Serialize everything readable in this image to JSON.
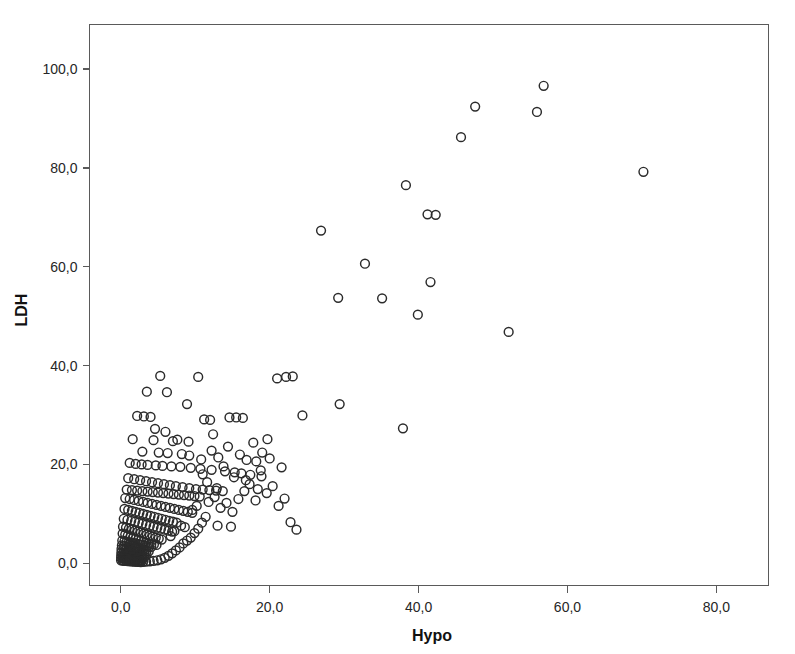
{
  "chart_data": {
    "type": "scatter",
    "title": "",
    "xlabel": "Hypo",
    "ylabel": "LDH",
    "xlim": [
      -4.2,
      87.0
    ],
    "ylim": [
      -4.5,
      109.0
    ],
    "grid": false,
    "legend": null,
    "marker": {
      "shape": "open-circle",
      "radius_px": 4.4,
      "stroke_color": "#2b2b2b",
      "stroke_width_px": 1.45,
      "fill": "none"
    },
    "xticks": [
      0,
      20,
      40,
      60,
      80
    ],
    "xtick_labels": [
      "0,0",
      "20,0",
      "40,0",
      "60,0",
      "80,0"
    ],
    "yticks": [
      0,
      20,
      40,
      60,
      80,
      100
    ],
    "ytick_labels": [
      "0,0",
      "20,0",
      "40,0",
      "60,0",
      "80,0",
      "100,0"
    ],
    "decimal_separator": ",",
    "n_points": 301,
    "points": [
      [
        56.8,
        96.6
      ],
      [
        47.6,
        92.4
      ],
      [
        55.9,
        91.3
      ],
      [
        45.7,
        86.2
      ],
      [
        70.2,
        79.2
      ],
      [
        38.3,
        76.5
      ],
      [
        41.2,
        70.6
      ],
      [
        42.3,
        70.5
      ],
      [
        26.9,
        67.3
      ],
      [
        32.8,
        60.6
      ],
      [
        41.6,
        56.9
      ],
      [
        29.2,
        53.7
      ],
      [
        35.1,
        53.6
      ],
      [
        52.1,
        46.8
      ],
      [
        39.9,
        50.3
      ],
      [
        29.4,
        32.2
      ],
      [
        37.9,
        27.3
      ],
      [
        23.1,
        37.8
      ],
      [
        22.2,
        37.7
      ],
      [
        21.0,
        37.4
      ],
      [
        10.4,
        37.7
      ],
      [
        5.3,
        37.9
      ],
      [
        8.9,
        32.2
      ],
      [
        3.5,
        34.7
      ],
      [
        6.2,
        34.6
      ],
      [
        2.2,
        29.8
      ],
      [
        3.1,
        29.7
      ],
      [
        4.0,
        29.6
      ],
      [
        14.6,
        29.5
      ],
      [
        15.5,
        29.5
      ],
      [
        16.4,
        29.4
      ],
      [
        11.2,
        29.1
      ],
      [
        12.0,
        29.0
      ],
      [
        1.6,
        25.1
      ],
      [
        4.4,
        24.9
      ],
      [
        7.0,
        24.7
      ],
      [
        9.1,
        24.6
      ],
      [
        2.9,
        22.6
      ],
      [
        5.1,
        22.4
      ],
      [
        6.3,
        22.3
      ],
      [
        8.2,
        22.1
      ],
      [
        13.1,
        21.4
      ],
      [
        16.9,
        20.9
      ],
      [
        18.2,
        20.6
      ],
      [
        24.4,
        29.9
      ],
      [
        12.4,
        26.1
      ],
      [
        19.7,
        25.1
      ],
      [
        1.2,
        20.3
      ],
      [
        2.0,
        20.1
      ],
      [
        2.8,
        20.0
      ],
      [
        3.6,
        19.9
      ],
      [
        4.7,
        19.8
      ],
      [
        5.6,
        19.7
      ],
      [
        6.8,
        19.6
      ],
      [
        8.0,
        19.5
      ],
      [
        9.4,
        19.3
      ],
      [
        10.7,
        19.1
      ],
      [
        12.2,
        18.9
      ],
      [
        14.0,
        18.6
      ],
      [
        15.3,
        18.4
      ],
      [
        16.2,
        18.2
      ],
      [
        17.4,
        17.9
      ],
      [
        18.9,
        17.6
      ],
      [
        1.0,
        17.2
      ],
      [
        1.8,
        17.0
      ],
      [
        2.6,
        16.8
      ],
      [
        3.4,
        16.6
      ],
      [
        4.2,
        16.4
      ],
      [
        5.0,
        16.2
      ],
      [
        5.8,
        16.0
      ],
      [
        6.6,
        15.8
      ],
      [
        7.4,
        15.6
      ],
      [
        8.3,
        15.4
      ],
      [
        9.2,
        15.2
      ],
      [
        10.1,
        15.0
      ],
      [
        11.0,
        14.9
      ],
      [
        11.9,
        14.8
      ],
      [
        12.8,
        14.7
      ],
      [
        13.7,
        14.6
      ],
      [
        0.8,
        14.9
      ],
      [
        1.5,
        14.8
      ],
      [
        2.2,
        14.7
      ],
      [
        2.9,
        14.6
      ],
      [
        3.6,
        14.5
      ],
      [
        4.3,
        14.4
      ],
      [
        5.0,
        14.3
      ],
      [
        5.7,
        14.2
      ],
      [
        6.4,
        14.1
      ],
      [
        7.1,
        14.0
      ],
      [
        7.8,
        13.9
      ],
      [
        8.5,
        13.8
      ],
      [
        9.2,
        13.7
      ],
      [
        9.9,
        13.6
      ],
      [
        10.6,
        13.5
      ],
      [
        0.6,
        13.2
      ],
      [
        1.2,
        13.0
      ],
      [
        1.8,
        12.8
      ],
      [
        2.4,
        12.6
      ],
      [
        3.0,
        12.4
      ],
      [
        3.6,
        12.2
      ],
      [
        4.2,
        12.0
      ],
      [
        4.8,
        11.8
      ],
      [
        5.4,
        11.6
      ],
      [
        6.0,
        11.4
      ],
      [
        6.6,
        11.2
      ],
      [
        7.2,
        11.0
      ],
      [
        7.8,
        10.8
      ],
      [
        8.4,
        10.6
      ],
      [
        9.0,
        10.4
      ],
      [
        9.6,
        10.2
      ],
      [
        0.5,
        11.0
      ],
      [
        1.0,
        10.8
      ],
      [
        1.5,
        10.6
      ],
      [
        2.0,
        10.4
      ],
      [
        2.5,
        10.2
      ],
      [
        3.0,
        10.0
      ],
      [
        3.5,
        9.8
      ],
      [
        4.0,
        9.6
      ],
      [
        4.5,
        9.4
      ],
      [
        5.0,
        9.2
      ],
      [
        5.5,
        9.0
      ],
      [
        6.0,
        8.8
      ],
      [
        6.5,
        8.6
      ],
      [
        7.0,
        8.4
      ],
      [
        7.5,
        8.2
      ],
      [
        0.4,
        9.0
      ],
      [
        0.9,
        8.8
      ],
      [
        1.4,
        8.6
      ],
      [
        1.9,
        8.4
      ],
      [
        2.4,
        8.2
      ],
      [
        2.9,
        8.0
      ],
      [
        3.4,
        7.8
      ],
      [
        3.9,
        7.6
      ],
      [
        4.4,
        7.4
      ],
      [
        4.9,
        7.2
      ],
      [
        5.4,
        7.0
      ],
      [
        5.9,
        6.8
      ],
      [
        6.4,
        6.6
      ],
      [
        6.9,
        6.4
      ],
      [
        0.3,
        7.4
      ],
      [
        0.7,
        7.2
      ],
      [
        1.1,
        7.0
      ],
      [
        1.5,
        6.8
      ],
      [
        1.9,
        6.6
      ],
      [
        2.3,
        6.4
      ],
      [
        2.7,
        6.2
      ],
      [
        3.1,
        6.0
      ],
      [
        3.5,
        5.8
      ],
      [
        3.9,
        5.6
      ],
      [
        4.3,
        5.4
      ],
      [
        4.7,
        5.2
      ],
      [
        5.1,
        5.0
      ],
      [
        5.5,
        4.8
      ],
      [
        0.25,
        6.0
      ],
      [
        0.6,
        5.8
      ],
      [
        0.95,
        5.6
      ],
      [
        1.3,
        5.4
      ],
      [
        1.65,
        5.2
      ],
      [
        2.0,
        5.0
      ],
      [
        2.35,
        4.8
      ],
      [
        2.7,
        4.6
      ],
      [
        3.05,
        4.4
      ],
      [
        3.4,
        4.2
      ],
      [
        3.75,
        4.0
      ],
      [
        4.1,
        3.9
      ],
      [
        4.45,
        3.8
      ],
      [
        4.8,
        3.7
      ],
      [
        0.2,
        4.6
      ],
      [
        0.5,
        4.5
      ],
      [
        0.8,
        4.4
      ],
      [
        1.1,
        4.3
      ],
      [
        1.4,
        4.2
      ],
      [
        1.7,
        4.1
      ],
      [
        2.0,
        4.0
      ],
      [
        2.3,
        3.9
      ],
      [
        2.6,
        3.8
      ],
      [
        2.9,
        3.7
      ],
      [
        3.2,
        3.6
      ],
      [
        3.5,
        3.5
      ],
      [
        3.8,
        3.4
      ],
      [
        4.1,
        3.3
      ],
      [
        0.15,
        3.6
      ],
      [
        0.45,
        3.5
      ],
      [
        0.75,
        3.4
      ],
      [
        1.05,
        3.3
      ],
      [
        1.35,
        3.2
      ],
      [
        1.65,
        3.1
      ],
      [
        1.95,
        3.0
      ],
      [
        2.25,
        2.9
      ],
      [
        2.55,
        2.8
      ],
      [
        2.85,
        2.7
      ],
      [
        3.15,
        2.6
      ],
      [
        3.45,
        2.5
      ],
      [
        3.75,
        2.4
      ],
      [
        0.1,
        2.9
      ],
      [
        0.38,
        2.8
      ],
      [
        0.66,
        2.7
      ],
      [
        0.94,
        2.6
      ],
      [
        1.22,
        2.5
      ],
      [
        1.5,
        2.4
      ],
      [
        1.78,
        2.3
      ],
      [
        2.06,
        2.2
      ],
      [
        2.34,
        2.1
      ],
      [
        2.62,
        2.0
      ],
      [
        2.9,
        1.9
      ],
      [
        3.18,
        1.8
      ],
      [
        3.46,
        1.7
      ],
      [
        0.08,
        2.2
      ],
      [
        0.34,
        2.1
      ],
      [
        0.6,
        2.0
      ],
      [
        0.86,
        1.95
      ],
      [
        1.12,
        1.9
      ],
      [
        1.38,
        1.85
      ],
      [
        1.64,
        1.8
      ],
      [
        1.9,
        1.75
      ],
      [
        2.16,
        1.7
      ],
      [
        2.42,
        1.6
      ],
      [
        2.68,
        1.5
      ],
      [
        2.94,
        1.4
      ],
      [
        3.2,
        1.3
      ],
      [
        0.06,
        1.6
      ],
      [
        0.3,
        1.55
      ],
      [
        0.54,
        1.5
      ],
      [
        0.78,
        1.45
      ],
      [
        1.02,
        1.4
      ],
      [
        1.26,
        1.35
      ],
      [
        1.5,
        1.3
      ],
      [
        1.74,
        1.25
      ],
      [
        1.98,
        1.2
      ],
      [
        2.22,
        1.15
      ],
      [
        2.46,
        1.1
      ],
      [
        2.7,
        1.05
      ],
      [
        2.94,
        1.0
      ],
      [
        0.05,
        1.1
      ],
      [
        0.28,
        1.05
      ],
      [
        0.51,
        1.0
      ],
      [
        0.74,
        0.95
      ],
      [
        0.97,
        0.9
      ],
      [
        1.2,
        0.85
      ],
      [
        1.43,
        0.8
      ],
      [
        1.66,
        0.75
      ],
      [
        1.89,
        0.7
      ],
      [
        2.12,
        0.65
      ],
      [
        2.35,
        0.6
      ],
      [
        2.58,
        0.55
      ],
      [
        2.81,
        0.5
      ],
      [
        0.04,
        0.6
      ],
      [
        0.26,
        0.55
      ],
      [
        0.48,
        0.5
      ],
      [
        0.7,
        0.48
      ],
      [
        0.92,
        0.45
      ],
      [
        1.14,
        0.42
      ],
      [
        1.36,
        0.4
      ],
      [
        1.58,
        0.38
      ],
      [
        1.8,
        0.35
      ],
      [
        2.02,
        0.32
      ],
      [
        2.24,
        0.3
      ],
      [
        2.46,
        0.28
      ],
      [
        2.68,
        0.25
      ],
      [
        3.0,
        0.3
      ],
      [
        3.4,
        0.35
      ],
      [
        3.9,
        0.4
      ],
      [
        4.4,
        0.5
      ],
      [
        4.9,
        0.6
      ],
      [
        5.4,
        0.8
      ],
      [
        5.9,
        1.1
      ],
      [
        6.4,
        1.5
      ],
      [
        6.9,
        2.0
      ],
      [
        7.4,
        2.6
      ],
      [
        7.9,
        3.2
      ],
      [
        8.4,
        4.0
      ],
      [
        8.9,
        4.6
      ],
      [
        9.4,
        5.2
      ],
      [
        9.9,
        6.1
      ],
      [
        10.4,
        7.0
      ],
      [
        10.9,
        8.2
      ],
      [
        11.4,
        9.4
      ],
      [
        8.1,
        7.6
      ],
      [
        8.6,
        7.3
      ],
      [
        7.2,
        6.5
      ],
      [
        6.7,
        5.5
      ],
      [
        9.6,
        10.8
      ],
      [
        10.2,
        11.6
      ],
      [
        11.8,
        12.4
      ],
      [
        12.6,
        13.4
      ],
      [
        13.4,
        11.2
      ],
      [
        14.2,
        12.2
      ],
      [
        15.0,
        10.4
      ],
      [
        15.8,
        13.0
      ],
      [
        16.6,
        14.6
      ],
      [
        17.3,
        16.0
      ],
      [
        18.1,
        12.7
      ],
      [
        13.0,
        7.6
      ],
      [
        14.8,
        7.4
      ],
      [
        18.8,
        18.8
      ],
      [
        19.6,
        14.2
      ],
      [
        20.4,
        15.6
      ],
      [
        21.2,
        11.6
      ],
      [
        22.0,
        13.1
      ],
      [
        22.8,
        8.3
      ],
      [
        23.6,
        6.8
      ],
      [
        20.0,
        21.2
      ],
      [
        21.6,
        19.4
      ],
      [
        19.0,
        22.4
      ],
      [
        17.8,
        24.4
      ],
      [
        16.0,
        22.0
      ],
      [
        14.4,
        23.6
      ],
      [
        12.2,
        22.8
      ],
      [
        10.8,
        21.0
      ],
      [
        9.2,
        21.8
      ],
      [
        7.6,
        25.0
      ],
      [
        6.0,
        26.6
      ],
      [
        4.6,
        27.2
      ],
      [
        11.6,
        16.4
      ],
      [
        12.9,
        15.2
      ],
      [
        15.2,
        17.4
      ],
      [
        16.8,
        16.8
      ],
      [
        18.4,
        15.0
      ],
      [
        13.8,
        19.6
      ],
      [
        11.0,
        18.0
      ]
    ]
  },
  "axes": {
    "x_title": "Hypo",
    "y_title": "LDH"
  }
}
